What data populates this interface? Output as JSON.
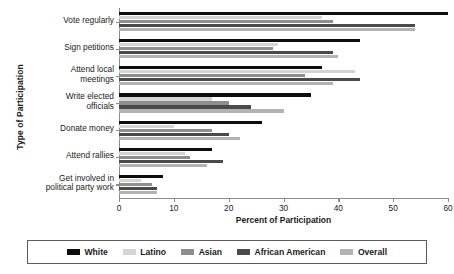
{
  "chart_data": {
    "type": "bar",
    "orientation": "horizontal",
    "title": "",
    "xlabel": "Percent of Participation",
    "ylabel": "Type of Participation",
    "xlim": [
      0,
      60
    ],
    "xticks": [
      0,
      10,
      20,
      30,
      40,
      50,
      60
    ],
    "grid": false,
    "legend_position": "bottom",
    "categories": [
      "Vote regularly",
      "Sign petitions",
      "Attend local meetings",
      "Write elected officials",
      "Donate money",
      "Attend rallies",
      "Get involved in political party work"
    ],
    "series": [
      {
        "name": "White",
        "color": "#0d0d0d",
        "values": [
          60,
          44,
          37,
          35,
          26,
          17,
          8
        ]
      },
      {
        "name": "Latino",
        "color": "#d4d4d4",
        "values": [
          37,
          29,
          43,
          17,
          10,
          12,
          4
        ]
      },
      {
        "name": "Asian",
        "color": "#8e8e8e",
        "values": [
          39,
          28,
          34,
          20,
          17,
          13,
          6
        ]
      },
      {
        "name": "African American",
        "color": "#4a4a4a",
        "values": [
          54,
          39,
          44,
          24,
          20,
          19,
          7
        ]
      },
      {
        "name": "Overall",
        "color": "#b3b3b3",
        "values": [
          54,
          40,
          39,
          30,
          22,
          16,
          7
        ]
      }
    ]
  },
  "legend": {
    "items": [
      {
        "label": "White"
      },
      {
        "label": "Latino"
      },
      {
        "label": "Asian"
      },
      {
        "label": "African American"
      },
      {
        "label": "Overall"
      }
    ]
  },
  "category_lines": [
    [
      "Vote regularly"
    ],
    [
      "Sign petitions"
    ],
    [
      "Attend local",
      "meetings"
    ],
    [
      "Write elected",
      "officials"
    ],
    [
      "Donate money"
    ],
    [
      "Attend rallies"
    ],
    [
      "Get involved in",
      "political party work"
    ]
  ]
}
